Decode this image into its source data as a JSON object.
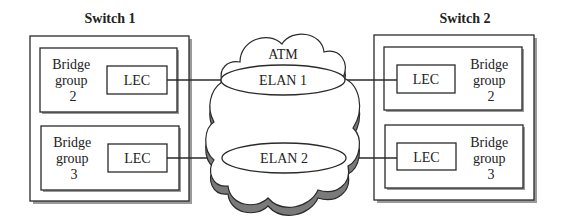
{
  "diagram": {
    "type": "network-topology",
    "switches": [
      {
        "label": "Switch 1",
        "bridge_groups": [
          {
            "label_lines": [
              "Bridge",
              "group",
              "2"
            ],
            "lec_label": "LEC"
          },
          {
            "label_lines": [
              "Bridge",
              "group",
              "3"
            ],
            "lec_label": "LEC"
          }
        ]
      },
      {
        "label": "Switch 2",
        "bridge_groups": [
          {
            "label_lines": [
              "Bridge",
              "group",
              "2"
            ],
            "lec_label": "LEC"
          },
          {
            "label_lines": [
              "Bridge",
              "group",
              "3"
            ],
            "lec_label": "LEC"
          }
        ]
      }
    ],
    "cloud": {
      "label": "ATM",
      "elans": [
        {
          "label": "ELAN 1"
        },
        {
          "label": "ELAN 2"
        }
      ]
    },
    "connections": [
      {
        "from": "Switch 1 / Bridge group 2 / LEC",
        "to": "ELAN 1"
      },
      {
        "from": "ELAN 1",
        "to": "Switch 2 / Bridge group 2 / LEC"
      },
      {
        "from": "Switch 1 / Bridge group 3 / LEC",
        "to": "ELAN 2"
      },
      {
        "from": "ELAN 2",
        "to": "Switch 2 / Bridge group 3 / LEC"
      }
    ]
  }
}
